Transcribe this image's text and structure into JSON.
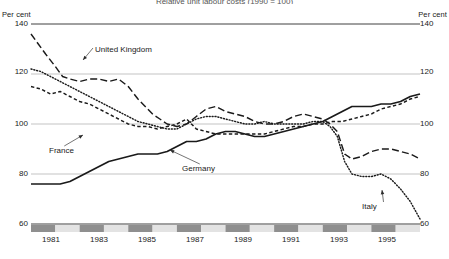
{
  "chart_data": {
    "type": "line",
    "title": "Relative unit labour costs (1990 = 100)",
    "ylabel_left": "Per cent",
    "ylabel_right": "Per cent",
    "xlabel": "",
    "ylim": [
      60,
      140
    ],
    "yticks": [
      140,
      120,
      100,
      80,
      60
    ],
    "xticks": [
      "1981",
      "1983",
      "1985",
      "1987",
      "1989",
      "1991",
      "1993",
      "1995"
    ],
    "xlim": [
      1980,
      1996
    ],
    "grid": true,
    "legend_position": "inline-annotations",
    "series": [
      {
        "name": "United Kingdom",
        "style": "long-dash",
        "color": "#1a1a1a",
        "x": [
          1980.0,
          1980.3,
          1980.6,
          1981.0,
          1981.3,
          1981.6,
          1982.0,
          1982.4,
          1982.8,
          1983.2,
          1983.6,
          1984.0,
          1984.4,
          1984.8,
          1985.0,
          1985.3,
          1985.6,
          1986.0,
          1986.4,
          1986.8,
          1987.2,
          1987.6,
          1988.0,
          1988.4,
          1988.8,
          1989.2,
          1989.6,
          1990.0,
          1990.4,
          1990.8,
          1991.2,
          1991.6,
          1992.0,
          1992.3,
          1992.6,
          1992.9,
          1993.2,
          1993.6,
          1994.0,
          1994.4,
          1994.8,
          1995.2,
          1995.6,
          1996.0
        ],
        "values": [
          136,
          132,
          128,
          123,
          119,
          118,
          117,
          118,
          118,
          117,
          118,
          115,
          110,
          106,
          104,
          102,
          100,
          99,
          100,
          103,
          106,
          107,
          105,
          104,
          103,
          101,
          100,
          100,
          101,
          103,
          104,
          103,
          102,
          100,
          97,
          88,
          86,
          87,
          89,
          90,
          90,
          89,
          88,
          86
        ]
      },
      {
        "name": "Italy",
        "style": "dotted",
        "color": "#1a1a1a",
        "x": [
          1980.0,
          1980.4,
          1980.8,
          1981.2,
          1981.6,
          1982.0,
          1982.4,
          1982.8,
          1983.2,
          1983.6,
          1984.0,
          1984.4,
          1984.8,
          1985.2,
          1985.6,
          1986.0,
          1986.4,
          1986.8,
          1987.2,
          1987.6,
          1988.0,
          1988.4,
          1988.8,
          1989.2,
          1989.6,
          1990.0,
          1990.4,
          1990.8,
          1991.2,
          1991.6,
          1992.0,
          1992.3,
          1992.6,
          1992.9,
          1993.2,
          1993.6,
          1994.0,
          1994.4,
          1994.8,
          1995.2,
          1995.6,
          1996.0
        ],
        "values": [
          122,
          121,
          119,
          117,
          115,
          113,
          111,
          109,
          107,
          105,
          103,
          101,
          100,
          99,
          98,
          98,
          100,
          102,
          103,
          103,
          102,
          101,
          100,
          100,
          101,
          100,
          100,
          100,
          100,
          101,
          101,
          99,
          95,
          85,
          80,
          79,
          79,
          80,
          78,
          74,
          69,
          62
        ]
      },
      {
        "name": "France",
        "style": "short-dash",
        "color": "#1a1a1a",
        "x": [
          1980.0,
          1980.4,
          1980.8,
          1981.2,
          1981.6,
          1982.0,
          1982.4,
          1982.8,
          1983.2,
          1983.6,
          1984.0,
          1984.4,
          1984.8,
          1985.2,
          1985.6,
          1986.0,
          1986.4,
          1986.8,
          1987.2,
          1987.6,
          1988.0,
          1988.4,
          1988.8,
          1989.2,
          1989.6,
          1990.0,
          1990.4,
          1990.8,
          1991.2,
          1991.6,
          1992.0,
          1992.4,
          1992.8,
          1993.2,
          1993.6,
          1994.0,
          1994.4,
          1994.8,
          1995.2,
          1995.6,
          1996.0
        ],
        "values": [
          115,
          114,
          112,
          113,
          111,
          109,
          108,
          106,
          104,
          102,
          100,
          99,
          99,
          98,
          99,
          100,
          102,
          98,
          97,
          96,
          96,
          96,
          96,
          96,
          96,
          97,
          98,
          99,
          99,
          100,
          100,
          101,
          101,
          102,
          103,
          104,
          106,
          107,
          108,
          110,
          111
        ]
      },
      {
        "name": "Germany",
        "style": "solid",
        "color": "#1a1a1a",
        "x": [
          1980.0,
          1980.4,
          1980.8,
          1981.2,
          1981.6,
          1982.0,
          1982.4,
          1982.8,
          1983.2,
          1983.6,
          1984.0,
          1984.4,
          1984.8,
          1985.2,
          1985.6,
          1986.0,
          1986.4,
          1986.8,
          1987.2,
          1987.6,
          1988.0,
          1988.4,
          1988.8,
          1989.2,
          1989.6,
          1990.0,
          1990.4,
          1990.8,
          1991.2,
          1991.6,
          1992.0,
          1992.4,
          1992.8,
          1993.2,
          1993.6,
          1994.0,
          1994.4,
          1994.8,
          1995.2,
          1995.6,
          1996.0
        ],
        "values": [
          76,
          76,
          76,
          76,
          77,
          79,
          81,
          83,
          85,
          86,
          87,
          88,
          88,
          88,
          89,
          91,
          93,
          93,
          94,
          96,
          97,
          97,
          96,
          95,
          95,
          96,
          97,
          98,
          99,
          100,
          101,
          103,
          105,
          107,
          107,
          107,
          108,
          108,
          109,
          111,
          112
        ]
      }
    ],
    "annotations": [
      {
        "text": "United Kingdom",
        "x_px": 95,
        "y_px": 46,
        "arrow_to_x": 83,
        "arrow_to_y": 60
      },
      {
        "text": "France",
        "x_px": 49,
        "y_px": 147,
        "arrow_to_x": 83,
        "arrow_to_y": 135
      },
      {
        "text": "Germany",
        "x_px": 182,
        "y_px": 165,
        "arrow_to_x": 170,
        "arrow_to_y": 150
      },
      {
        "text": "Italy",
        "x_px": 362,
        "y_px": 203,
        "arrow_to_x": 382,
        "arrow_to_y": 190
      }
    ],
    "axis_band": {
      "colors": [
        "#8f8f8f",
        "#e3e3e3"
      ],
      "segments": 16
    }
  }
}
